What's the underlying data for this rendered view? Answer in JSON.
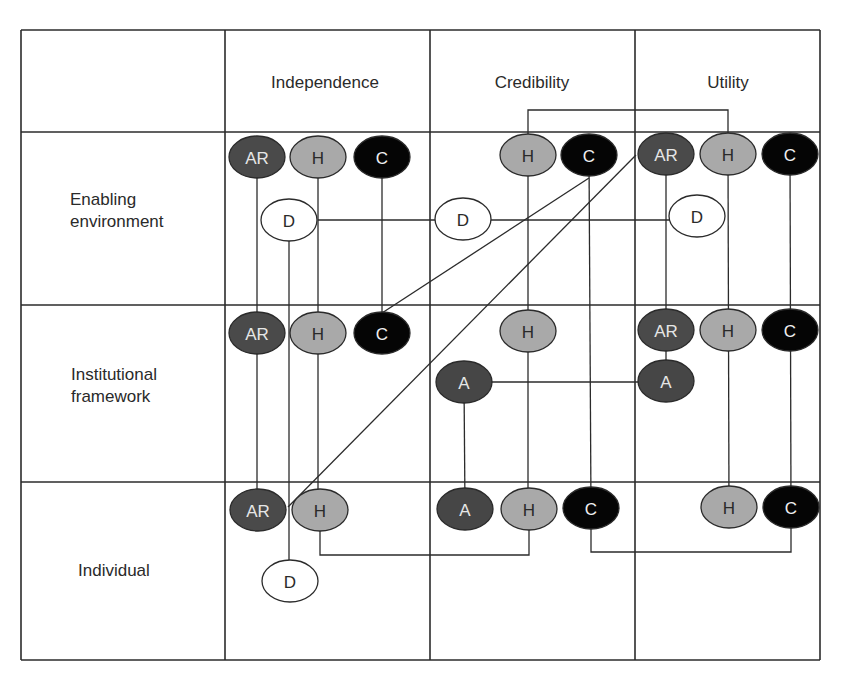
{
  "colors": {
    "line": "#2b2b2b",
    "node_types": {
      "AR": {
        "fill": "#4a4a4a",
        "text": "#e6e6e6"
      },
      "A": {
        "fill": "#464646",
        "text": "#e6e6e6"
      },
      "H": {
        "fill": "#a9a9a9",
        "text": "#2a2a2a"
      },
      "C": {
        "fill": "#050505",
        "text": "#f0f0f0"
      },
      "D": {
        "fill": "#ffffff",
        "text": "#2a2a2a"
      }
    }
  },
  "grid": {
    "x": [
      21,
      225,
      430,
      635,
      820
    ],
    "y": [
      30,
      132,
      305,
      482,
      660
    ]
  },
  "columns": [
    {
      "id": "independence",
      "label": "Independence",
      "cx": 325,
      "cy": 82
    },
    {
      "id": "credibility",
      "label": "Credibility",
      "cx": 532,
      "cy": 82
    },
    {
      "id": "utility",
      "label": "Utility",
      "cx": 728,
      "cy": 82
    }
  ],
  "rows": [
    {
      "id": "enabling-environment",
      "lines": [
        "Enabling",
        "environment"
      ],
      "x": 70,
      "y": 205
    },
    {
      "id": "institutional-framework",
      "lines": [
        "Institutional",
        "framework"
      ],
      "x": 71,
      "y": 380
    },
    {
      "id": "individual",
      "lines": [
        "Individual"
      ],
      "x": 78,
      "y": 576
    }
  ],
  "nodes": [
    {
      "id": "ee-ind-ar",
      "type": "AR",
      "label": "AR",
      "x": 257,
      "y": 157
    },
    {
      "id": "ee-ind-h",
      "type": "H",
      "label": "H",
      "x": 318,
      "y": 157
    },
    {
      "id": "ee-ind-c",
      "type": "C",
      "label": "C",
      "x": 382,
      "y": 157
    },
    {
      "id": "ee-ind-d",
      "type": "D",
      "label": "D",
      "x": 289,
      "y": 220
    },
    {
      "id": "ee-cre-h",
      "type": "H",
      "label": "H",
      "x": 528,
      "y": 155
    },
    {
      "id": "ee-cre-c",
      "type": "C",
      "label": "C",
      "x": 589,
      "y": 155
    },
    {
      "id": "ee-cre-d",
      "type": "D",
      "label": "D",
      "x": 463,
      "y": 219
    },
    {
      "id": "ee-uti-ar",
      "type": "AR",
      "label": "AR",
      "x": 666,
      "y": 154
    },
    {
      "id": "ee-uti-h",
      "type": "H",
      "label": "H",
      "x": 728,
      "y": 154
    },
    {
      "id": "ee-uti-c",
      "type": "C",
      "label": "C",
      "x": 790,
      "y": 154
    },
    {
      "id": "ee-uti-d",
      "type": "D",
      "label": "D",
      "x": 697,
      "y": 216
    },
    {
      "id": "if-ind-ar",
      "type": "AR",
      "label": "AR",
      "x": 257,
      "y": 333
    },
    {
      "id": "if-ind-h",
      "type": "H",
      "label": "H",
      "x": 318,
      "y": 333
    },
    {
      "id": "if-ind-c",
      "type": "C",
      "label": "C",
      "x": 382,
      "y": 333
    },
    {
      "id": "if-cre-h",
      "type": "H",
      "label": "H",
      "x": 528,
      "y": 331
    },
    {
      "id": "if-cre-a",
      "type": "A",
      "label": "A",
      "x": 464,
      "y": 382
    },
    {
      "id": "if-uti-ar",
      "type": "AR",
      "label": "AR",
      "x": 666,
      "y": 330
    },
    {
      "id": "if-uti-h",
      "type": "H",
      "label": "H",
      "x": 728,
      "y": 330
    },
    {
      "id": "if-uti-c",
      "type": "C",
      "label": "C",
      "x": 790,
      "y": 330
    },
    {
      "id": "if-uti-a",
      "type": "A",
      "label": "A",
      "x": 666,
      "y": 381
    },
    {
      "id": "in-ind-ar",
      "type": "AR",
      "label": "AR",
      "x": 258,
      "y": 510
    },
    {
      "id": "in-ind-h",
      "type": "H",
      "label": "H",
      "x": 320,
      "y": 510
    },
    {
      "id": "in-ind-d",
      "type": "D",
      "label": "D",
      "x": 290,
      "y": 581
    },
    {
      "id": "in-cre-a",
      "type": "A",
      "label": "A",
      "x": 465,
      "y": 509
    },
    {
      "id": "in-cre-h",
      "type": "H",
      "label": "H",
      "x": 529,
      "y": 509
    },
    {
      "id": "in-cre-c",
      "type": "C",
      "label": "C",
      "x": 591,
      "y": 508
    },
    {
      "id": "in-uti-h",
      "type": "H",
      "label": "H",
      "x": 729,
      "y": 507
    },
    {
      "id": "in-uti-c",
      "type": "C",
      "label": "C",
      "x": 791,
      "y": 507
    }
  ],
  "connectors": [
    {
      "id": "ind-ar-vertical",
      "points": [
        [
          257,
          157
        ],
        [
          257,
          510
        ]
      ]
    },
    {
      "id": "ind-h-vertical",
      "points": [
        [
          318,
          157
        ],
        [
          318,
          510
        ]
      ]
    },
    {
      "id": "ind-c-vertical",
      "points": [
        [
          382,
          157
        ],
        [
          382,
          333
        ]
      ]
    },
    {
      "id": "ind-d-vertical",
      "points": [
        [
          289,
          220
        ],
        [
          289,
          581
        ]
      ]
    },
    {
      "id": "d-horizontal-link",
      "points": [
        [
          318,
          220
        ],
        [
          697,
          220
        ]
      ]
    },
    {
      "id": "cre-h-vertical",
      "points": [
        [
          528,
          155
        ],
        [
          528,
          509
        ]
      ]
    },
    {
      "id": "cre-c-vertical",
      "points": [
        [
          589,
          155
        ],
        [
          591,
          508
        ]
      ]
    },
    {
      "id": "cre-h-to-uti-h-bracket",
      "points": [
        [
          528,
          155
        ],
        [
          528,
          110
        ],
        [
          728,
          110
        ],
        [
          728,
          154
        ]
      ]
    },
    {
      "id": "uti-ar-vertical",
      "points": [
        [
          666,
          154
        ],
        [
          666,
          381
        ]
      ]
    },
    {
      "id": "uti-h-vertical",
      "points": [
        [
          728,
          154
        ],
        [
          729,
          507
        ]
      ]
    },
    {
      "id": "uti-c-vertical",
      "points": [
        [
          790,
          154
        ],
        [
          791,
          507
        ]
      ]
    },
    {
      "id": "diagonal-cre-c-to-ind-c",
      "points": [
        [
          589,
          178
        ],
        [
          382,
          313
        ]
      ]
    },
    {
      "id": "diagonal-uti-ar-to-individual",
      "points": [
        [
          636,
          155
        ],
        [
          288,
          507
        ]
      ]
    },
    {
      "id": "a-horizontal-link",
      "points": [
        [
          464,
          382
        ],
        [
          666,
          382
        ]
      ]
    },
    {
      "id": "a-vertical-link",
      "points": [
        [
          464,
          382
        ],
        [
          465,
          509
        ]
      ]
    },
    {
      "id": "ind-h-to-cre-h-bracket",
      "points": [
        [
          320,
          510
        ],
        [
          320,
          555
        ],
        [
          529,
          555
        ],
        [
          529,
          509
        ]
      ]
    },
    {
      "id": "cre-c-to-uti-c-bracket",
      "points": [
        [
          591,
          508
        ],
        [
          591,
          552
        ],
        [
          791,
          552
        ],
        [
          791,
          507
        ]
      ]
    }
  ],
  "node_size": {
    "rx": 28,
    "ry": 21
  }
}
